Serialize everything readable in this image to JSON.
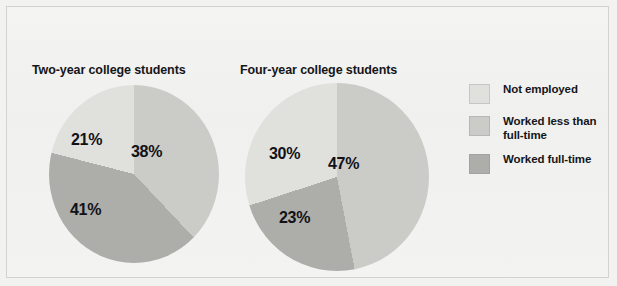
{
  "figure": {
    "background_color": "#f2f2f0",
    "frame_color": "#d2d2d0"
  },
  "legend": {
    "items": [
      {
        "label": "Not employed",
        "color": "#e0e0dd",
        "key": "not_employed"
      },
      {
        "label": "Worked less than full-time",
        "color": "#cbcbc8",
        "key": "worked_less_than_full_time"
      },
      {
        "label": "Worked full-time",
        "color": "#adadaa",
        "key": "worked_full_time"
      }
    ]
  },
  "chart_data": [
    {
      "type": "pie",
      "title": "Two-year college students",
      "categories": [
        "Worked less than full-time",
        "Worked full-time",
        "Not employed"
      ],
      "values": [
        38,
        41,
        21
      ],
      "labels": [
        "38%",
        "41%",
        "21%"
      ],
      "colors": [
        "#cbcbc8",
        "#adadaa",
        "#e0e0dd"
      ],
      "start_angle_deg": 0,
      "direction": "clockwise",
      "units": "percent",
      "legend_position": "right"
    },
    {
      "type": "pie",
      "title": "Four-year college students",
      "categories": [
        "Worked less than full-time",
        "Worked full-time",
        "Not employed"
      ],
      "values": [
        47,
        23,
        30
      ],
      "labels": [
        "47%",
        "23%",
        "30%"
      ],
      "colors": [
        "#cbcbc8",
        "#adadaa",
        "#e0e0dd"
      ],
      "start_angle_deg": 0,
      "direction": "clockwise",
      "units": "percent",
      "legend_position": "right"
    }
  ]
}
